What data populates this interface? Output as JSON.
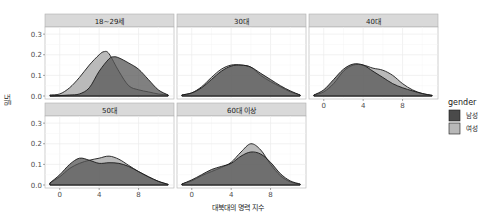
{
  "chart_data": {
    "type": "area",
    "subtype": "density (faceted)",
    "title": "",
    "xlabel": "대북대의 명력 지수",
    "ylabel": "밀도",
    "xlim": [
      -1.5,
      11.6
    ],
    "ylim": [
      0,
      0.32
    ],
    "x_ticks": [
      0,
      4,
      8
    ],
    "y_ticks": [
      "0.0",
      "0.1",
      "0.2",
      "0.3"
    ],
    "grid": true,
    "legend": {
      "title": "gender",
      "position": "right",
      "entries": [
        {
          "label": "남성",
          "color": "#4a4a4a"
        },
        {
          "label": "여성",
          "color": "#b8b8b8"
        }
      ]
    },
    "facets": [
      {
        "label": "18~29세",
        "series": [
          {
            "name": "남성",
            "x": [
              -1,
              0,
              1,
              2,
              3,
              4,
              5,
              5.5,
              6,
              7,
              8,
              9,
              10,
              11
            ],
            "y": [
              0.0,
              0.002,
              0.005,
              0.01,
              0.04,
              0.12,
              0.18,
              0.19,
              0.185,
              0.16,
              0.13,
              0.08,
              0.03,
              0.005
            ]
          },
          {
            "name": "여성",
            "x": [
              -1,
              0,
              1,
              2,
              3,
              4,
              4.5,
              5,
              6,
              7,
              8,
              9,
              10,
              11
            ],
            "y": [
              0.005,
              0.01,
              0.04,
              0.09,
              0.15,
              0.2,
              0.215,
              0.205,
              0.12,
              0.05,
              0.03,
              0.02,
              0.01,
              0.005
            ]
          }
        ]
      },
      {
        "label": "30대",
        "series": [
          {
            "name": "남성",
            "x": [
              -1,
              0,
              1,
              2,
              3,
              4,
              5,
              6,
              7,
              8,
              9,
              10,
              11
            ],
            "y": [
              0.005,
              0.015,
              0.04,
              0.08,
              0.12,
              0.145,
              0.15,
              0.14,
              0.11,
              0.08,
              0.05,
              0.025,
              0.005
            ]
          },
          {
            "name": "여성",
            "x": [
              -1,
              0,
              1,
              2,
              3,
              4,
              5,
              6,
              7,
              8,
              9,
              10,
              11
            ],
            "y": [
              0.005,
              0.015,
              0.045,
              0.09,
              0.13,
              0.15,
              0.15,
              0.14,
              0.1,
              0.07,
              0.045,
              0.02,
              0.005
            ]
          }
        ]
      },
      {
        "label": "40대",
        "series": [
          {
            "name": "남성",
            "x": [
              -1,
              0,
              1,
              2,
              3,
              4,
              5,
              6,
              7,
              8,
              9,
              10,
              11
            ],
            "y": [
              0.005,
              0.03,
              0.08,
              0.13,
              0.155,
              0.15,
              0.12,
              0.09,
              0.06,
              0.04,
              0.025,
              0.012,
              0.003
            ]
          },
          {
            "name": "여성",
            "x": [
              -1,
              0,
              1,
              2,
              3,
              4,
              5,
              6,
              7,
              8,
              9,
              10,
              11
            ],
            "y": [
              0.005,
              0.02,
              0.06,
              0.12,
              0.15,
              0.15,
              0.135,
              0.125,
              0.1,
              0.06,
              0.03,
              0.012,
              0.003
            ]
          }
        ]
      },
      {
        "label": "50대",
        "series": [
          {
            "name": "남성",
            "x": [
              -1,
              0,
              1,
              2,
              3,
              4,
              5,
              6,
              7,
              8,
              9,
              10,
              11
            ],
            "y": [
              0.01,
              0.05,
              0.1,
              0.13,
              0.12,
              0.105,
              0.108,
              0.105,
              0.09,
              0.065,
              0.04,
              0.018,
              0.003
            ]
          },
          {
            "name": "여성",
            "x": [
              -1,
              0,
              1,
              2,
              3,
              4,
              5,
              6,
              7,
              8,
              9,
              10,
              11
            ],
            "y": [
              0.01,
              0.04,
              0.08,
              0.105,
              0.12,
              0.13,
              0.14,
              0.125,
              0.095,
              0.065,
              0.04,
              0.018,
              0.003
            ]
          }
        ]
      },
      {
        "label": "60대 이상",
        "series": [
          {
            "name": "남성",
            "x": [
              -1,
              0,
              1,
              2,
              3,
              4,
              5,
              6,
              7,
              8,
              9,
              10,
              11
            ],
            "y": [
              0.005,
              0.025,
              0.05,
              0.075,
              0.09,
              0.105,
              0.14,
              0.16,
              0.15,
              0.11,
              0.055,
              0.02,
              0.005
            ]
          },
          {
            "name": "여성",
            "x": [
              -1,
              0,
              1,
              2,
              3,
              4,
              5,
              6,
              7,
              8,
              9,
              10,
              11
            ],
            "y": [
              0.005,
              0.02,
              0.045,
              0.065,
              0.085,
              0.11,
              0.16,
              0.2,
              0.17,
              0.1,
              0.045,
              0.015,
              0.004
            ]
          }
        ]
      }
    ]
  },
  "colors": {
    "male_fill": "#555555",
    "female_fill": "#b3b3b3",
    "strip_bg": "#d9d9d9",
    "panel_border": "#b0b0b0",
    "grid": "#ebebeb",
    "outline": "#1a1a1a"
  }
}
